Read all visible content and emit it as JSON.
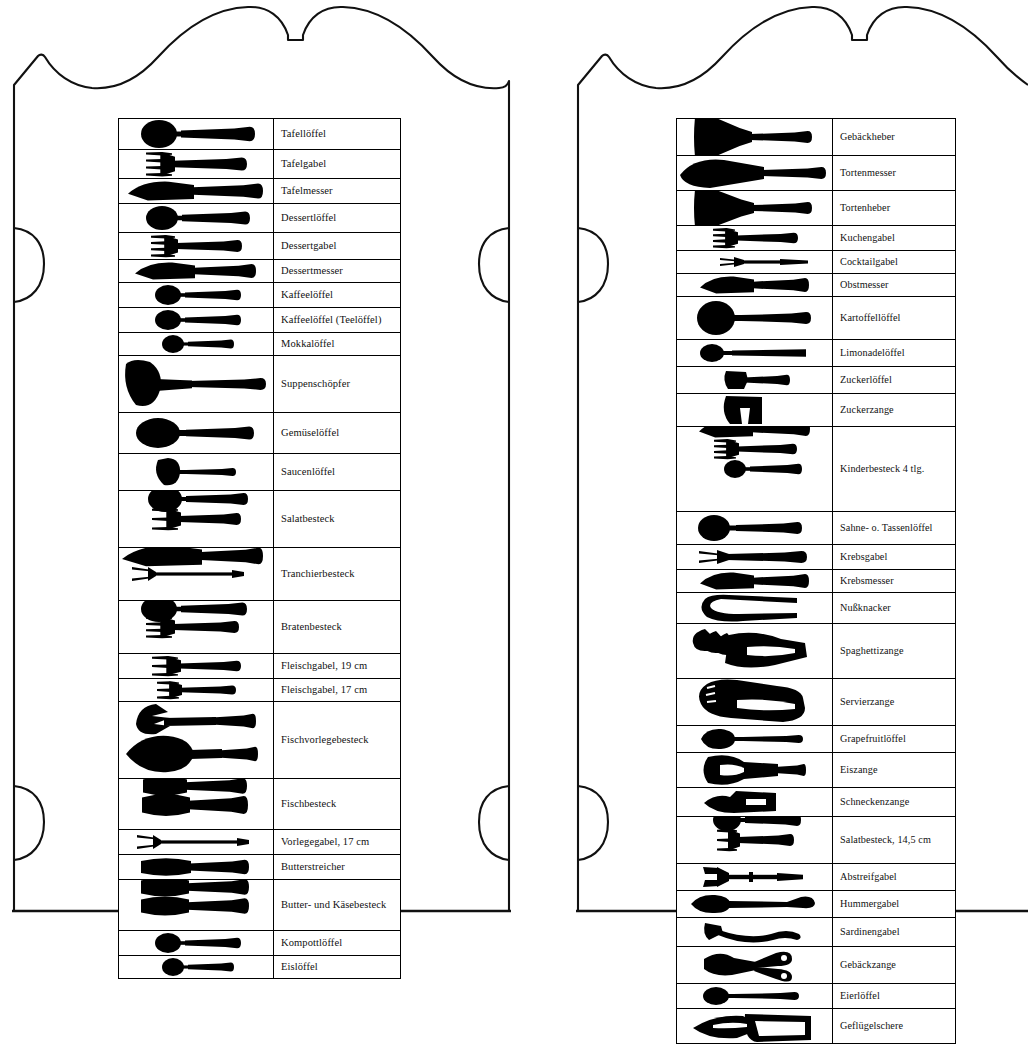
{
  "document": {
    "title": "Besteckteile Übersicht",
    "panel_count": 2,
    "frame_style": "ornate-scalloped-plaque-outline"
  },
  "left_panel": {
    "name": "left-plaque",
    "table": {
      "name": "cutlery-table-left",
      "row_count": 24,
      "rows": [
        {
          "label": "Tafellöffel",
          "icon": "spoon-large",
          "pieces": 1
        },
        {
          "label": "Tafelgabel",
          "icon": "fork-large",
          "pieces": 1
        },
        {
          "label": "Tafelmesser",
          "icon": "knife-large",
          "pieces": 1
        },
        {
          "label": "Dessertlöffel",
          "icon": "spoon-medium",
          "pieces": 1
        },
        {
          "label": "Dessertgabel",
          "icon": "fork-medium",
          "pieces": 1
        },
        {
          "label": "Dessertmesser",
          "icon": "knife-medium",
          "pieces": 1
        },
        {
          "label": "Kaffeelöffel",
          "icon": "spoon-small",
          "pieces": 1
        },
        {
          "label": "Kaffeelöffel (Teelöffel)",
          "icon": "spoon-small",
          "pieces": 1
        },
        {
          "label": "Mokkalöffel",
          "icon": "spoon-tiny",
          "pieces": 1
        },
        {
          "label": "Suppenschöpfer",
          "icon": "ladle",
          "pieces": 1
        },
        {
          "label": "Gemüselöffel",
          "icon": "spoon-serving",
          "pieces": 1
        },
        {
          "label": "Saucenlöffel",
          "icon": "sauce-ladle",
          "pieces": 1
        },
        {
          "label": "Salatbesteck",
          "icon": "salad-serving-set",
          "pieces": 2
        },
        {
          "label": "Tranchierbesteck",
          "icon": "carving-set",
          "pieces": 2
        },
        {
          "label": "Bratenbesteck",
          "icon": "roast-serving-set",
          "pieces": 2
        },
        {
          "label": "Fleischgabel, 19 cm",
          "icon": "meat-fork-19",
          "pieces": 1
        },
        {
          "label": "Fleischgabel, 17 cm",
          "icon": "meat-fork-17",
          "pieces": 1
        },
        {
          "label": "Fischvorlegebesteck",
          "icon": "fish-serving-set",
          "pieces": 2
        },
        {
          "label": "Fischbesteck",
          "icon": "fish-cutlery-set",
          "pieces": 2
        },
        {
          "label": "Vorlegegabel, 17 cm",
          "icon": "serving-fork-thin",
          "pieces": 1
        },
        {
          "label": "Butterstreicher",
          "icon": "butter-spreader",
          "pieces": 1
        },
        {
          "label": "Butter- und Käsebesteck",
          "icon": "butter-cheese-set",
          "pieces": 2
        },
        {
          "label": "Kompottlöffel",
          "icon": "spoon-small",
          "pieces": 1
        },
        {
          "label": "Eislöffel",
          "icon": "spoon-tiny",
          "pieces": 1
        }
      ]
    }
  },
  "right_panel": {
    "name": "right-plaque",
    "table": {
      "name": "cutlery-table-right",
      "row_count": 26,
      "rows": [
        {
          "label": "Gebäckheber",
          "icon": "pastry-server",
          "pieces": 1
        },
        {
          "label": "Tortenmesser",
          "icon": "cake-knife",
          "pieces": 1
        },
        {
          "label": "Tortenheber",
          "icon": "cake-server",
          "pieces": 1
        },
        {
          "label": "Kuchengabel",
          "icon": "cake-fork",
          "pieces": 1
        },
        {
          "label": "Cocktailgabel",
          "icon": "cocktail-fork",
          "pieces": 1
        },
        {
          "label": "Obstmesser",
          "icon": "fruit-knife",
          "pieces": 1
        },
        {
          "label": "Kartoffellöffel",
          "icon": "potato-spoon",
          "pieces": 1
        },
        {
          "label": "Limonadelöffel",
          "icon": "lemonade-spoon",
          "pieces": 1
        },
        {
          "label": "Zuckerlöffel",
          "icon": "sugar-spoon",
          "pieces": 1
        },
        {
          "label": "Zuckerzange",
          "icon": "sugar-tongs",
          "pieces": 1
        },
        {
          "label": "Kinderbesteck 4 tlg.",
          "icon": "children-set-4pc",
          "pieces": 4
        },
        {
          "label": "Sahne- o. Tassenlöffel",
          "icon": "cream-cup-spoon",
          "pieces": 1
        },
        {
          "label": "Krebsgabel",
          "icon": "crab-fork",
          "pieces": 1
        },
        {
          "label": "Krebsmesser",
          "icon": "crab-knife",
          "pieces": 1
        },
        {
          "label": "Nußknacker",
          "icon": "nutcracker",
          "pieces": 1
        },
        {
          "label": "Spaghettizange",
          "icon": "spaghetti-tongs",
          "pieces": 1
        },
        {
          "label": "Servierzange",
          "icon": "serving-tongs",
          "pieces": 1
        },
        {
          "label": "Grapefruitlöffel",
          "icon": "grapefruit-spoon",
          "pieces": 1
        },
        {
          "label": "Eiszange",
          "icon": "ice-tongs",
          "pieces": 1
        },
        {
          "label": "Schneckenzange",
          "icon": "snail-tongs",
          "pieces": 1
        },
        {
          "label": "Salatbesteck, 14,5 cm",
          "icon": "salad-set-small",
          "pieces": 2
        },
        {
          "label": "Abstreifgabel",
          "icon": "stripping-fork",
          "pieces": 1
        },
        {
          "label": "Hummergabel",
          "icon": "lobster-fork",
          "pieces": 1
        },
        {
          "label": "Sardinengabel",
          "icon": "sardine-fork",
          "pieces": 1
        },
        {
          "label": "Gebäckzange",
          "icon": "pastry-tongs",
          "pieces": 1
        },
        {
          "label": "Eierlöffel",
          "icon": "egg-spoon",
          "pieces": 1
        },
        {
          "label": "Geflügelschere",
          "icon": "poultry-shears",
          "pieces": 1
        }
      ]
    }
  },
  "colors": {
    "ink": "#000000",
    "paper": "#ffffff",
    "rule": "#000000"
  }
}
